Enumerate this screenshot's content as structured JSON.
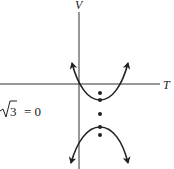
{
  "figure": {
    "axes": {
      "x_label": "T",
      "y_label": "V"
    },
    "equation_fragment": {
      "radical": "√",
      "radicand": "3",
      "rest": "= 0"
    },
    "curves": [
      {
        "name": "upper-branch",
        "opens": "up"
      },
      {
        "name": "lower-branch",
        "opens": "down"
      }
    ],
    "points_count": 5,
    "ink_color": "#222222"
  }
}
